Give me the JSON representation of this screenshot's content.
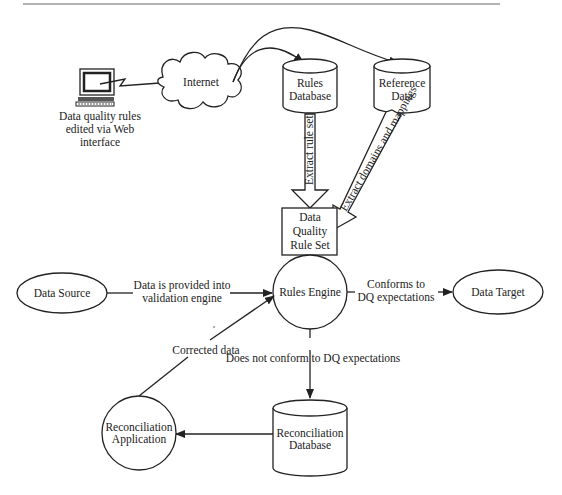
{
  "diagram": {
    "nodes": {
      "web_client": {
        "label_lines": [
          "Data quality rules",
          "edited via Web",
          "interface"
        ]
      },
      "internet": {
        "label": "Internet"
      },
      "rules_database": {
        "label_lines": [
          "Rules",
          "Database"
        ]
      },
      "reference_data": {
        "label_lines": [
          "Reference",
          "Data"
        ]
      },
      "dq_rule_set": {
        "label_lines": [
          "Data",
          "Quality",
          "Rule Set"
        ]
      },
      "data_source": {
        "label": "Data Source"
      },
      "rules_engine": {
        "label": "Rules Engine"
      },
      "data_target": {
        "label": "Data Target"
      },
      "reconciliation_database": {
        "label_lines": [
          "Reconciliation",
          "Database"
        ]
      },
      "reconciliation_application": {
        "label_lines": [
          "Reconciliation",
          "Application"
        ]
      }
    },
    "edges": {
      "extract_rule_set": {
        "label": "Extract rule set"
      },
      "extract_domains": {
        "label": "Extract domains and mappings"
      },
      "data_provided": {
        "label_lines": [
          "Data is provided into",
          "validation engine"
        ]
      },
      "conforms": {
        "label_lines": [
          "Conforms to",
          "DQ expectations"
        ]
      },
      "not_conform": {
        "label": "Does not conform to DQ expectations"
      },
      "corrected": {
        "label": "Corrected data"
      }
    }
  }
}
